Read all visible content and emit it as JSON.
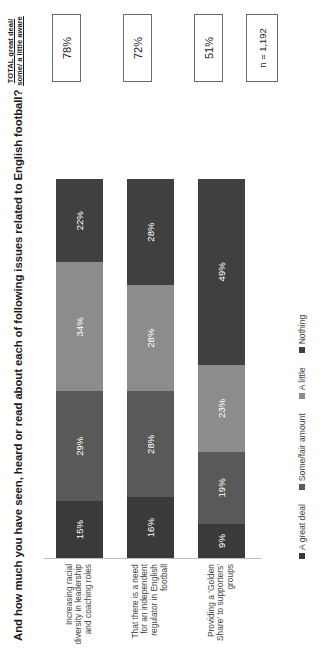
{
  "chart_data": {
    "type": "bar",
    "subtype": "stacked-horizontal-100",
    "title": "And how much you have seen, heard or read about each of following issues related to English football?",
    "xlabel": "",
    "ylabel": "",
    "xlim": [
      0,
      100
    ],
    "grid": false,
    "legend_position": "bottom-left",
    "categories": [
      "Increasing racial diversity in leadership and coaching roles",
      "That there is a need for an independent regulator in English football",
      "Providing a ‘Golden Share’ to supporters’ groups"
    ],
    "series": [
      {
        "name": "A great deal",
        "color": "#3a3a3a",
        "values": [
          15,
          16,
          9
        ]
      },
      {
        "name": "Some/fair amount",
        "color": "#595959",
        "values": [
          29,
          28,
          19
        ]
      },
      {
        "name": "A little",
        "color": "#8c8c8c",
        "values": [
          34,
          28,
          23
        ]
      },
      {
        "name": "Nothing",
        "color": "#404040",
        "values": [
          22,
          28,
          49
        ]
      }
    ],
    "value_labels": [
      [
        "15%",
        "29%",
        "34%",
        "22%"
      ],
      [
        "16%",
        "28%",
        "28%",
        "28%"
      ],
      [
        "9%",
        "19%",
        "23%",
        "49%"
      ]
    ],
    "totals_column": {
      "header": "TOTAL great deal/ some/ a little aware",
      "values": [
        "78%",
        "72%",
        "51%"
      ]
    },
    "annotations": {
      "base_size": "n = 1,192"
    }
  },
  "title": "And how much you have seen, heard or read about each of following issues related to English football?",
  "total_header": "TOTAL great deal/ some/ a little aware",
  "bars": [
    {
      "category": "Increasing racial diversity in leadership and coaching roles",
      "total": "78%",
      "segments": [
        {
          "label": "15%",
          "value": 15,
          "color": "#3a3a3a"
        },
        {
          "label": "29%",
          "value": 29,
          "color": "#595959"
        },
        {
          "label": "34%",
          "value": 34,
          "color": "#8c8c8c"
        },
        {
          "label": "22%",
          "value": 22,
          "color": "#404040"
        }
      ]
    },
    {
      "category": "That there is a need for an independent regulator in English football",
      "total": "72%",
      "segments": [
        {
          "label": "16%",
          "value": 16,
          "color": "#3a3a3a"
        },
        {
          "label": "28%",
          "value": 28,
          "color": "#595959"
        },
        {
          "label": "28%",
          "value": 28,
          "color": "#8c8c8c"
        },
        {
          "label": "28%",
          "value": 28,
          "color": "#404040"
        }
      ]
    },
    {
      "category": "Providing a ‘Golden Share’ to supporters’ groups",
      "total": "51%",
      "segments": [
        {
          "label": "9%",
          "value": 9,
          "color": "#3a3a3a"
        },
        {
          "label": "19%",
          "value": 19,
          "color": "#595959"
        },
        {
          "label": "23%",
          "value": 23,
          "color": "#8c8c8c"
        },
        {
          "label": "49%",
          "value": 49,
          "color": "#404040"
        }
      ]
    }
  ],
  "legend": [
    {
      "label": "A great deal",
      "color": "#3a3a3a"
    },
    {
      "label": "Some/fair amount",
      "color": "#595959"
    },
    {
      "label": "A little",
      "color": "#8c8c8c"
    },
    {
      "label": "Nothing",
      "color": "#404040"
    }
  ],
  "base_note": "n = 1,192"
}
